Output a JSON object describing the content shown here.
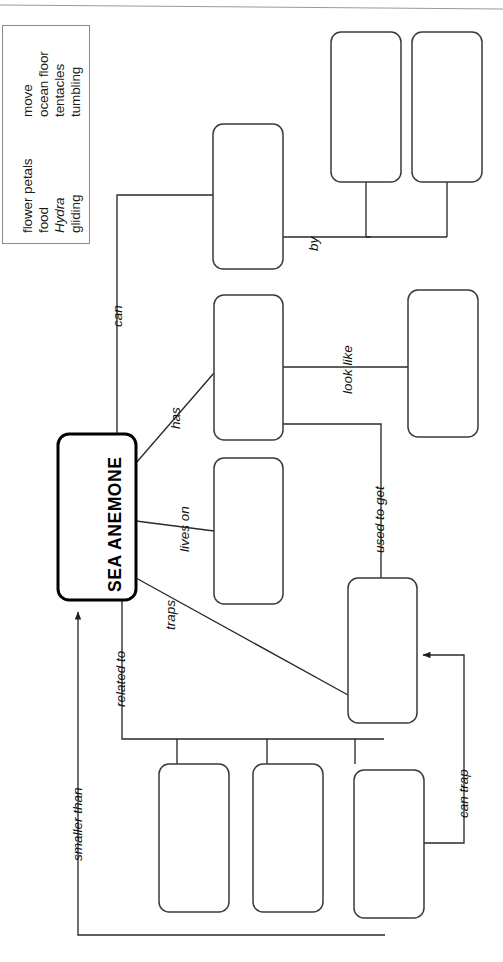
{
  "document": {
    "type": "concept-map-worksheet",
    "center_node": "SEA ANEMONE",
    "ink_color": "#222222",
    "box_stroke": "#3a3a3a",
    "bank_stroke": "#8a8a8a"
  },
  "word_bank": {
    "label": "word-bank",
    "column_1": [
      {
        "text": "flower petals",
        "italic": false
      },
      {
        "text": "food",
        "italic": false
      },
      {
        "text": "Hydra",
        "italic": true
      },
      {
        "text": "gliding",
        "italic": false
      }
    ],
    "column_2": [
      {
        "text": "move",
        "italic": false
      },
      {
        "text": "ocean floor",
        "italic": false
      },
      {
        "text": "tentacles",
        "italic": false
      },
      {
        "text": "tumbling",
        "italic": false
      }
    ]
  },
  "links": [
    {
      "id": "can",
      "label": "can"
    },
    {
      "id": "by",
      "label": "by"
    },
    {
      "id": "has",
      "label": "has"
    },
    {
      "id": "look-like",
      "label": "look like"
    },
    {
      "id": "lives-on",
      "label": "lives on"
    },
    {
      "id": "used-to-get",
      "label": "used to get"
    },
    {
      "id": "traps",
      "label": "traps"
    },
    {
      "id": "related-to",
      "label": "related to"
    },
    {
      "id": "smaller-than",
      "label": "smaller than"
    },
    {
      "id": "can-trap",
      "label": "can trap"
    }
  ],
  "answer_boxes": [
    {
      "id": "box-can",
      "value": ""
    },
    {
      "id": "box-by-upper",
      "value": ""
    },
    {
      "id": "box-by-lower",
      "value": ""
    },
    {
      "id": "box-has",
      "value": ""
    },
    {
      "id": "box-look-like",
      "value": ""
    },
    {
      "id": "box-lives-on",
      "value": ""
    },
    {
      "id": "box-used-to-get",
      "value": ""
    },
    {
      "id": "box-bottom-1",
      "value": ""
    },
    {
      "id": "box-bottom-2",
      "value": ""
    },
    {
      "id": "box-bottom-3",
      "value": ""
    }
  ]
}
